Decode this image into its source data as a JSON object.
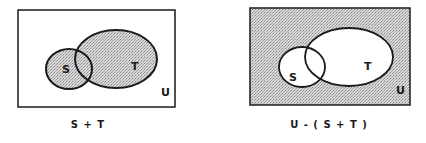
{
  "diagrams": [
    {
      "id": "left",
      "caption": "S + T",
      "universe_label": "U",
      "set_s_label": "S",
      "set_t_label": "T",
      "shaded_region": "S union T"
    },
    {
      "id": "right",
      "caption": "U - ( S + T )",
      "universe_label": "U",
      "set_s_label": "S",
      "set_t_label": "T",
      "shaded_region": "complement of S union T"
    }
  ],
  "colors": {
    "stroke": "#1a1a1a",
    "shade": "#c8c8c8",
    "background": "#ffffff"
  }
}
